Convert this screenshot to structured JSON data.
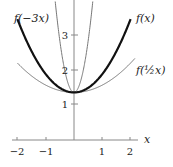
{
  "chart_data": {
    "type": "line",
    "title": "",
    "xlabel": "x",
    "ylabel": "",
    "xlim": [
      -2.2,
      2.2
    ],
    "ylim": [
      0,
      4
    ],
    "grid": false,
    "legend": "inline labels",
    "x_ticks": [
      -2,
      -1,
      1,
      2
    ],
    "x_tick_labels": [
      "−2",
      "−1",
      "1",
      "2"
    ],
    "y_ticks": [
      1,
      2,
      3
    ],
    "y_tick_labels": [
      "1",
      "2",
      "3"
    ],
    "series": [
      {
        "name": "f(x)",
        "label": "f(x)",
        "style": "thick",
        "color": "#111111",
        "x": [
          -2,
          -1.5,
          -1,
          -0.5,
          0,
          0.5,
          1,
          1.5,
          2
        ],
        "y": [
          3.48,
          2.55,
          1.89,
          1.49,
          1.36,
          1.49,
          1.89,
          2.55,
          3.48
        ]
      },
      {
        "name": "f(-3x)",
        "label": "f(−3x)",
        "style": "thin",
        "color": "#777777",
        "x": [
          -0.6,
          -0.4,
          -0.2,
          0,
          0.2,
          0.4,
          0.6
        ],
        "y": [
          3.8,
          2.5,
          1.55,
          1.36,
          1.55,
          2.5,
          3.8
        ]
      },
      {
        "name": "f(1/2 x)",
        "label": "f(½x)",
        "style": "thin",
        "color": "#777777",
        "x": [
          -2,
          -1,
          0,
          1,
          2
        ],
        "y": [
          1.89,
          1.49,
          1.36,
          1.49,
          1.89
        ]
      }
    ]
  },
  "labels": {
    "f": "f(x)",
    "f_neg3": "f(−3x)",
    "f_half": "f(½x)",
    "xaxis": "x"
  },
  "ticks": {
    "xm2": "−2",
    "xm1": "−1",
    "x1": "1",
    "x2": "2",
    "y1": "1",
    "y2": "2",
    "y3": "3"
  }
}
